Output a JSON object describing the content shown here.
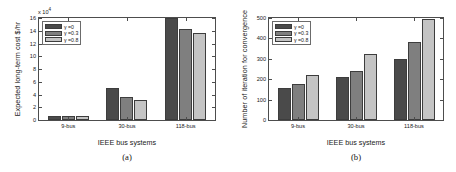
{
  "figure": {
    "panels": [
      {
        "id": "a",
        "caption": "(a)",
        "xlabel": "IEEE bus systems",
        "ylabel": "Expected long-term cost $/hr",
        "exponent_prefix": "x 10",
        "exponent_power": "4"
      },
      {
        "id": "b",
        "caption": "(b)",
        "xlabel": "IEEE bus systems",
        "ylabel": "Number of iteration for convergence",
        "exponent_prefix": "",
        "exponent_power": ""
      }
    ]
  },
  "colors": {
    "series_0": "#4a4a4a",
    "series_1": "#7f7f7f",
    "series_2": "#c4c4c4",
    "axis": "#4d4d4d",
    "background": "#ffffff"
  },
  "chart_data": [
    {
      "type": "bar",
      "panel": "a",
      "title": "",
      "xlabel": "IEEE bus systems",
      "ylabel": "Expected long-term cost $/hr",
      "categories": [
        "9-bus",
        "30-bus",
        "118-bus"
      ],
      "ylim": [
        0,
        16
      ],
      "yticks": [
        0,
        2,
        4,
        6,
        8,
        10,
        12,
        14,
        16
      ],
      "y_scale_note": "x 10^4",
      "grid": false,
      "legend_position": "upper left",
      "series": [
        {
          "name": "γ =0",
          "values": [
            0.62,
            5.1,
            16.0
          ]
        },
        {
          "name": "γ =0.3",
          "values": [
            0.6,
            3.6,
            14.35
          ]
        },
        {
          "name": "γ =0.8",
          "values": [
            0.58,
            3.18,
            13.65
          ]
        }
      ]
    },
    {
      "type": "bar",
      "panel": "b",
      "title": "",
      "xlabel": "IEEE bus systems",
      "ylabel": "Number of iteration for convergence",
      "categories": [
        "9-bus",
        "30-bus",
        "118-bus"
      ],
      "ylim": [
        0,
        500
      ],
      "yticks": [
        0,
        100,
        200,
        300,
        400,
        500
      ],
      "grid": false,
      "legend_position": "upper left",
      "series": [
        {
          "name": "γ =0",
          "values": [
            155,
            210,
            297
          ]
        },
        {
          "name": "γ =0.3",
          "values": [
            178,
            238,
            380
          ]
        },
        {
          "name": "γ =0.8",
          "values": [
            222,
            322,
            497
          ]
        }
      ]
    }
  ]
}
